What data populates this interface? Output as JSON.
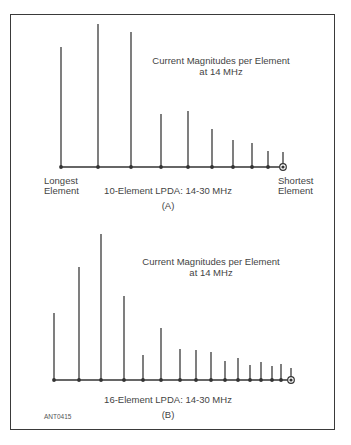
{
  "figure": {
    "id_label": "ANT0415",
    "panels": [
      {
        "key": "A",
        "title_line1": "Current Magnitudes per Element",
        "title_line2": "at 14 MHz",
        "caption": "10-Element LPDA:  14-30 MHz",
        "panel_label": "(A)",
        "left_label_line1": "Longest",
        "left_label_line2": "Element",
        "right_label_line1": "Shortest",
        "right_label_line2": "Element"
      },
      {
        "key": "B",
        "title_line1": "Current Magnitudes per Element",
        "title_line2": "at 14 MHz",
        "caption": "16-Element LPDA:  14-30 MHz",
        "panel_label": "(B)"
      }
    ]
  },
  "chart_data": [
    {
      "type": "stem",
      "title": "Current Magnitudes per Element at 14 MHz",
      "caption": "10-Element LPDA: 14-30 MHz",
      "panel": "(A)",
      "xlabel_left": "Longest Element",
      "xlabel_right": "Shortest Element",
      "values_are": "pixel coordinates measured from the image; no numeric scale is shown",
      "baseline_y": 167,
      "stems": [
        {
          "element": 1,
          "x": 61,
          "top": 47
        },
        {
          "element": 2,
          "x": 98,
          "top": 24
        },
        {
          "element": 3,
          "x": 131,
          "top": 32
        },
        {
          "element": 4,
          "x": 161,
          "top": 114
        },
        {
          "element": 5,
          "x": 188,
          "top": 111
        },
        {
          "element": 6,
          "x": 212,
          "top": 129
        },
        {
          "element": 7,
          "x": 233,
          "top": 140
        },
        {
          "element": 8,
          "x": 252,
          "top": 143
        },
        {
          "element": 9,
          "x": 268,
          "top": 151
        },
        {
          "element": 10,
          "x": 283,
          "top": 152,
          "feed_point": true
        }
      ]
    },
    {
      "type": "stem",
      "title": "Current Magnitudes per Element at 14 MHz",
      "caption": "16-Element LPDA: 14-30 MHz",
      "panel": "(B)",
      "values_are": "pixel coordinates measured from the image; no numeric scale is shown",
      "baseline_y": 380,
      "stems": [
        {
          "element": 1,
          "x": 54,
          "top": 313
        },
        {
          "element": 2,
          "x": 79,
          "top": 267
        },
        {
          "element": 3,
          "x": 101,
          "top": 234
        },
        {
          "element": 4,
          "x": 124,
          "top": 296
        },
        {
          "element": 5,
          "x": 143,
          "top": 355
        },
        {
          "element": 6,
          "x": 161,
          "top": 328
        },
        {
          "element": 7,
          "x": 180,
          "top": 349
        },
        {
          "element": 8,
          "x": 196,
          "top": 350
        },
        {
          "element": 9,
          "x": 211,
          "top": 352
        },
        {
          "element": 10,
          "x": 225,
          "top": 361
        },
        {
          "element": 11,
          "x": 238,
          "top": 358
        },
        {
          "element": 12,
          "x": 250,
          "top": 365
        },
        {
          "element": 13,
          "x": 261,
          "top": 362
        },
        {
          "element": 14,
          "x": 272,
          "top": 366
        },
        {
          "element": 15,
          "x": 281,
          "top": 364
        },
        {
          "element": 16,
          "x": 291,
          "top": 368,
          "feed_point": true
        }
      ]
    }
  ]
}
